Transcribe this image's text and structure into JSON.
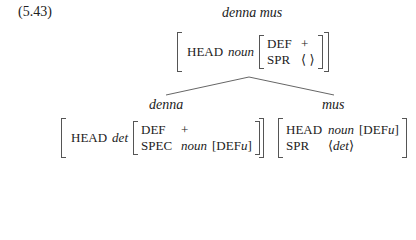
{
  "example_number": "(5.43)",
  "mother": {
    "label": "denna mus",
    "avm": {
      "head_feat": "HEAD",
      "head_type": "noun",
      "inner": [
        {
          "feat": "DEF",
          "val": "+"
        },
        {
          "feat": "SPR",
          "val": "⟨ ⟩"
        }
      ]
    }
  },
  "daughters": [
    {
      "label": "denna",
      "avm": {
        "head_feat": "HEAD",
        "head_type": "det",
        "inner": [
          {
            "feat": "DEF",
            "val": "+"
          },
          {
            "feat": "SPEC",
            "val_type": "noun",
            "val_bracket": "[DEF ",
            "val_var": "u",
            "val_close": "]"
          }
        ]
      }
    },
    {
      "label": "mus",
      "avm": {
        "rows": [
          {
            "feat": "HEAD",
            "val_type": "noun",
            "val_bracket": "[DEF ",
            "val_var": "u",
            "val_close": "]"
          },
          {
            "feat": "SPR",
            "val_open": "⟨",
            "val_type": "det",
            "val_close": "⟩"
          }
        ]
      }
    }
  ],
  "tree": {
    "line_color": "#555555",
    "apex": [
      249,
      77
    ],
    "left_end": [
      166,
      95
    ],
    "right_end": [
      334,
      95
    ]
  }
}
